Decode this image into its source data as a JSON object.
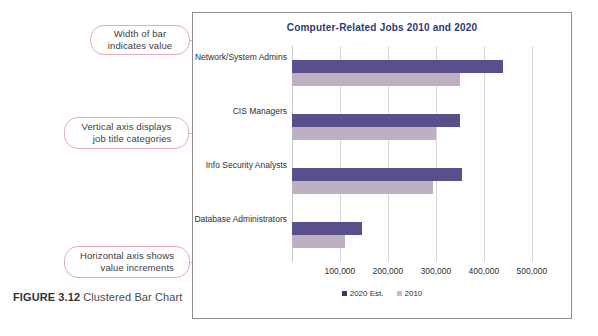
{
  "figure": {
    "label": "FIGURE 3.12",
    "caption": "Clustered Bar Chart"
  },
  "annotations": [
    {
      "name": "width-of-bar",
      "line1": "Width of bar",
      "line2": "indicates value"
    },
    {
      "name": "vertical-axis",
      "line1": "Vertical axis displays",
      "line2": "job title categories"
    },
    {
      "name": "horizontal-axis",
      "line1": "Horizontal axis shows",
      "line2": "value increments"
    }
  ],
  "colors": {
    "title": "#2e3a73",
    "series_2020": "#584f8c",
    "series_2010": "#bcb0c2",
    "callout_border": "#e8aab8",
    "frame_border": "#8d8d8d",
    "gridline": "#d5d5d8"
  },
  "chart_data": {
    "type": "bar",
    "orientation": "horizontal",
    "title": "Computer-Related Jobs 2010 and 2020",
    "xlabel": "",
    "ylabel": "",
    "categories": [
      "Network/System Admins",
      "CIS Managers",
      "Info Security Analysts",
      "Database Administrators"
    ],
    "series": [
      {
        "name": "2020 Est.",
        "color": "#584f8c",
        "values": [
          440000,
          350000,
          355000,
          145000
        ]
      },
      {
        "name": "2010",
        "color": "#bcb0c2",
        "values": [
          350000,
          300000,
          295000,
          110000
        ]
      }
    ],
    "xlim": [
      0,
      540000
    ],
    "xticks": [
      100000,
      200000,
      300000,
      400000,
      500000
    ],
    "xtick_labels": [
      "100,000",
      "200,000",
      "300,000",
      "400,000",
      "500,000"
    ],
    "grid": true,
    "legend_position": "bottom",
    "legend_entries": [
      "2020 Est.",
      "2010"
    ]
  }
}
